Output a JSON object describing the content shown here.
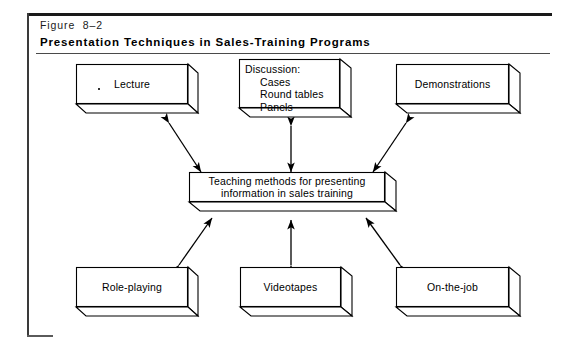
{
  "figure": {
    "number": "Figure  8–2",
    "title": "Presentation Techniques in Sales-Training Programs"
  },
  "diagram": {
    "type": "concept-map",
    "center": {
      "id": "center",
      "line1": "Teaching methods for presenting",
      "line2": "information in sales training"
    },
    "nodes": [
      {
        "id": "lecture",
        "label": "Lecture"
      },
      {
        "id": "discussion",
        "label": "Discussion:",
        "items": [
          "Cases",
          "Round tables",
          "Panels"
        ]
      },
      {
        "id": "demonstrations",
        "label": "Demonstrations"
      },
      {
        "id": "role-playing",
        "label": "Role-playing"
      },
      {
        "id": "videotapes",
        "label": "Videotapes"
      },
      {
        "id": "on-the-job",
        "label": "On-the-job"
      }
    ],
    "connections": [
      {
        "from": "lecture",
        "to": "center",
        "style": "double-headed-arrow"
      },
      {
        "from": "discussion",
        "to": "center",
        "style": "double-headed-arrow"
      },
      {
        "from": "demonstrations",
        "to": "center",
        "style": "double-headed-arrow"
      },
      {
        "from": "role-playing",
        "to": "center",
        "style": "double-headed-arrow"
      },
      {
        "from": "videotapes",
        "to": "center",
        "style": "double-headed-arrow"
      },
      {
        "from": "on-the-job",
        "to": "center",
        "style": "double-headed-arrow"
      }
    ]
  },
  "colors": {
    "ink": "#000000",
    "paper": "#ffffff",
    "rule": "#1a1a1a"
  }
}
